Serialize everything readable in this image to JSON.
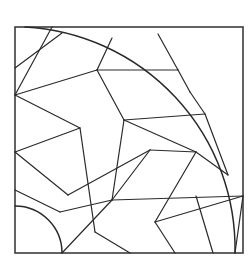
{
  "figure": {
    "type": "line-art-pattern",
    "caption": ""
  },
  "colors": {
    "background": "#ffffff",
    "line": "#2a2a2a",
    "frame": "#3c3c3c",
    "fill": "#ffffff"
  },
  "canvas": {
    "width": 250,
    "height": 266
  },
  "frame": {
    "x": 15,
    "y": 27,
    "width": 228,
    "height": 226,
    "stroke_width": 1.6
  },
  "geometry": {
    "hub": {
      "cx": 15,
      "cy": 253,
      "radius": 47,
      "label": "inner-hub-arc"
    },
    "outer_arc": {
      "cx": 15,
      "cy": 253,
      "radius": 222,
      "start_point": [
        25,
        27
      ],
      "end_point": [
        235,
        253
      ],
      "label": "outer-fan-arc"
    },
    "seams": [
      "M15,95 L97,70",
      "M15,95 L80,128",
      "M15,95 L52,27",
      "M15,68 L62,33",
      "M97,70 L112,38",
      "M97,70 L178,70",
      "M97,70 L124,120",
      "M178,70 L158,34",
      "M178,70 L190,92",
      "M124,120 L205,114",
      "M124,120 L196,152",
      "M124,120 L112,200",
      "M15,152 L80,128",
      "M80,128 L95,232",
      "M15,152 L68,195",
      "M15,190 L60,212",
      "M68,195 L150,150",
      "M60,212 L112,200",
      "M196,152 L228,175",
      "M196,152 L155,222",
      "M112,200 L243,196",
      "M112,200 L62,253",
      "M95,232 L130,253",
      "M155,222 L175,253",
      "M155,222 L243,196",
      "M205,114 L228,175",
      "M190,92 L205,114",
      "M213,253 L196,196",
      "M235,253 L243,196",
      "M150,150 L196,152",
      "M150,150 L112,200"
    ]
  }
}
